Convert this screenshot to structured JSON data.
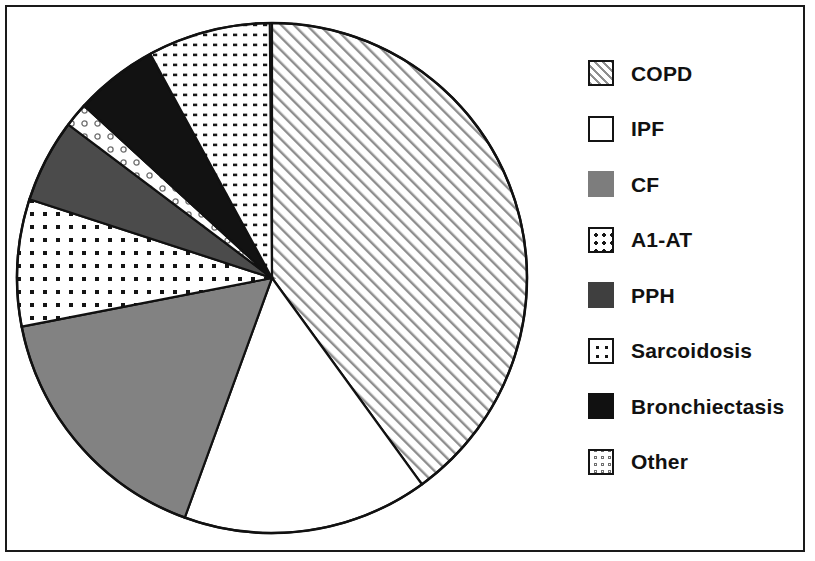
{
  "figure": {
    "type": "pie-chart-figure",
    "background": "#ffffff",
    "frame_color": "#1a1a1a"
  },
  "legend": {
    "position": "right",
    "items": [
      {
        "label": "COPD",
        "pattern": "diagonal-hatch",
        "swatch_name": "legend-swatch-copd"
      },
      {
        "label": "IPF",
        "pattern": "solid-white",
        "swatch_name": "legend-swatch-ipf"
      },
      {
        "label": "CF",
        "pattern": "solid-gray",
        "swatch_name": "legend-swatch-cf"
      },
      {
        "label": "A1-AT",
        "pattern": "medium-dots",
        "swatch_name": "legend-swatch-a1at"
      },
      {
        "label": "PPH",
        "pattern": "solid-dark-gray",
        "swatch_name": "legend-swatch-pph"
      },
      {
        "label": "Sarcoidosis",
        "pattern": "sparse-dots",
        "swatch_name": "legend-swatch-sarcoidosis"
      },
      {
        "label": "Bronchiectasis",
        "pattern": "solid-black",
        "swatch_name": "legend-swatch-bronchiectasis"
      },
      {
        "label": "Other",
        "pattern": "open-circles",
        "swatch_name": "legend-swatch-other"
      }
    ]
  },
  "chart_data": {
    "type": "pie",
    "title": "",
    "subtitle": "",
    "xlabel": "",
    "ylabel": "",
    "grid": false,
    "legend_position": "right",
    "units": "percent",
    "start_angle_deg": 90,
    "direction": "clockwise",
    "categories": [
      "COPD",
      "IPF",
      "CF",
      "A1-AT",
      "PPH",
      "Sarcoidosis",
      "Bronchiectasis",
      "Other"
    ],
    "values": [
      40.0,
      15.6,
      16.4,
      8.1,
      5.3,
      7.8,
      5.3,
      1.5
    ],
    "slices": [
      {
        "label": "COPD",
        "value": 40.0,
        "angle_deg": 144.0,
        "pattern": "diagonal-hatch",
        "fill": "#ffffff",
        "ink": "#9a9a9a"
      },
      {
        "label": "IPF",
        "value": 15.6,
        "angle_deg": 56.0,
        "pattern": "solid-white",
        "fill": "#ffffff",
        "ink": "#ffffff"
      },
      {
        "label": "CF",
        "value": 16.4,
        "angle_deg": 59.0,
        "pattern": "solid-gray",
        "fill": "#808080",
        "ink": "#808080"
      },
      {
        "label": "A1-AT",
        "value": 8.1,
        "angle_deg": 29.0,
        "pattern": "medium-dots",
        "fill": "#ffffff",
        "ink": "#1a1a1a"
      },
      {
        "label": "PPH",
        "value": 5.3,
        "angle_deg": 19.0,
        "pattern": "solid-dark-gray",
        "fill": "#4a4a4a",
        "ink": "#4a4a4a"
      },
      {
        "label": "Other",
        "value": 1.5,
        "angle_deg": 5.5,
        "pattern": "open-circles",
        "fill": "#ffffff",
        "ink": "#777777"
      },
      {
        "label": "Bronchiectasis",
        "value": 5.3,
        "angle_deg": 19.0,
        "pattern": "solid-black",
        "fill": "#111111",
        "ink": "#111111"
      },
      {
        "label": "Sarcoidosis",
        "value": 7.8,
        "angle_deg": 28.0,
        "pattern": "sparse-dots",
        "fill": "#ffffff",
        "ink": "#1a1a1a"
      }
    ],
    "geometry": {
      "center_x": 272,
      "center_y": 278,
      "radius": 255,
      "outline_color": "#111111",
      "outline_width": 2.5
    }
  }
}
